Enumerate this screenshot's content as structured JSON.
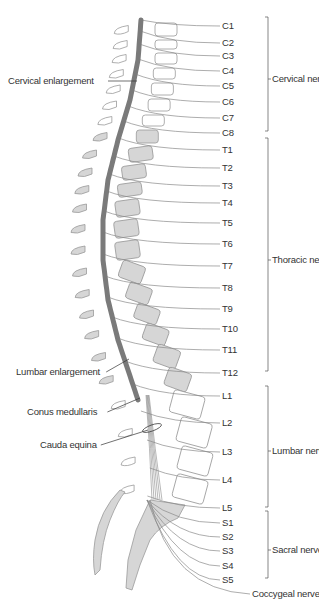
{
  "colors": {
    "background": "#ffffff",
    "cord": "#7a7a7a",
    "bone_fill": "#d6d6d6",
    "bone_stroke": "#9a9a9a",
    "line": "#8a8a8a",
    "text": "#333333"
  },
  "left_labels": [
    {
      "id": "cervical-enlargement",
      "text": "Cervical enlargement",
      "x": 8,
      "y": 76,
      "line_to": [
        137,
        81
      ]
    },
    {
      "id": "lumbar-enlargement",
      "text": "Lumbar enlargement",
      "x": 16,
      "y": 367,
      "line_to": [
        129,
        359
      ]
    },
    {
      "id": "conus-medullaris",
      "text": "Conus medullaris",
      "x": 27,
      "y": 407,
      "line_to": [
        140,
        398
      ]
    },
    {
      "id": "cauda-equina",
      "text": "Cauda equina",
      "x": 40,
      "y": 440,
      "line_to": [
        148,
        430
      ]
    }
  ],
  "segments": {
    "cervical": [
      {
        "label": "C1",
        "y": 21
      },
      {
        "label": "C2",
        "y": 38
      },
      {
        "label": "C3",
        "y": 51
      },
      {
        "label": "C4",
        "y": 66
      },
      {
        "label": "C5",
        "y": 81
      },
      {
        "label": "C6",
        "y": 97
      },
      {
        "label": "C7",
        "y": 113
      },
      {
        "label": "C8",
        "y": 128
      }
    ],
    "thoracic": [
      {
        "label": "T1",
        "y": 145
      },
      {
        "label": "T2",
        "y": 163
      },
      {
        "label": "T3",
        "y": 181
      },
      {
        "label": "T4",
        "y": 198
      },
      {
        "label": "T5",
        "y": 218
      },
      {
        "label": "T6",
        "y": 239
      },
      {
        "label": "T7",
        "y": 261
      },
      {
        "label": "T8",
        "y": 283
      },
      {
        "label": "T9",
        "y": 304
      },
      {
        "label": "T10",
        "y": 324
      },
      {
        "label": "T11",
        "y": 345
      },
      {
        "label": "T12",
        "y": 368
      }
    ],
    "lumbar": [
      {
        "label": "L1",
        "y": 391
      },
      {
        "label": "L2",
        "y": 418
      },
      {
        "label": "L3",
        "y": 447
      },
      {
        "label": "L4",
        "y": 475
      },
      {
        "label": "L5",
        "y": 503
      }
    ],
    "sacral": [
      {
        "label": "S1",
        "y": 518
      },
      {
        "label": "S2",
        "y": 532
      },
      {
        "label": "S3",
        "y": 546
      },
      {
        "label": "S4",
        "y": 561
      },
      {
        "label": "S5",
        "y": 575
      }
    ]
  },
  "groups": [
    {
      "id": "cervical-nerves",
      "text": "Cervical nerves",
      "top": 17,
      "bottom": 131,
      "label_y": 74
    },
    {
      "id": "thoracic-nerves",
      "text": "Thoracic nerves",
      "top": 138,
      "bottom": 371,
      "label_y": 255
    },
    {
      "id": "lumbar-nerves",
      "text": "Lumbar nerves",
      "top": 386,
      "bottom": 507,
      "label_y": 446
    },
    {
      "id": "sacral-nerves",
      "text": "Sacral nerves",
      "top": 511,
      "bottom": 578,
      "label_y": 545
    }
  ],
  "coccygeal": {
    "text": "Coccygeal nerve",
    "y": 589
  }
}
